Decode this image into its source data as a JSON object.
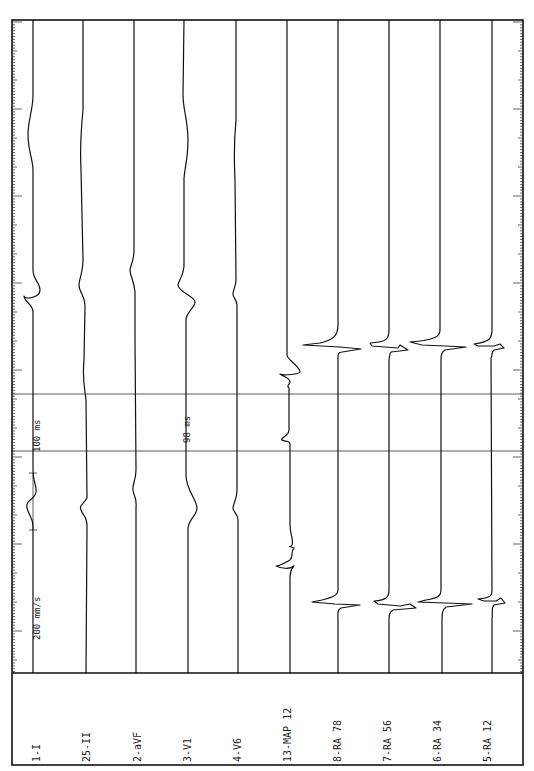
{
  "chart_data": {
    "type": "line",
    "orientation": "rotated-90",
    "paper_speed_label": "200 mm/s",
    "calibration_label": "100 ms",
    "caliper": {
      "label": "98 ms",
      "y1": 394,
      "y2": 451
    },
    "channels": [
      {
        "label": "1-I",
        "x": 33
      },
      {
        "label": "25-II",
        "x": 83
      },
      {
        "label": "2-aVF",
        "x": 134
      },
      {
        "label": "3-V1",
        "x": 184
      },
      {
        "label": "4-V6",
        "x": 236
      },
      {
        "label": "13-MAP 12",
        "x": 287
      },
      {
        "label": "8-RA 78",
        "x": 338
      },
      {
        "label": "7-RA 56",
        "x": 389
      },
      {
        "label": "6-RA 34",
        "x": 440
      },
      {
        "label": "5-RA 12",
        "x": 492
      }
    ],
    "events": [
      {
        "name": "surface-QRS-1",
        "y": 290
      },
      {
        "name": "surface-QRS-2",
        "y": 505
      },
      {
        "name": "RA-activation-1",
        "y": 345
      },
      {
        "name": "RA-activation-2",
        "y": 600
      },
      {
        "name": "MAP-activation-1",
        "y": 372
      },
      {
        "name": "MAP-activation-2",
        "y": 565
      }
    ]
  },
  "frame": {
    "left": 12,
    "right": 523,
    "top": 20,
    "divider": 673,
    "bottom": 765
  },
  "annotations": {
    "speed": "200 mm/s",
    "calibration": "100 ms",
    "interval": "98 ms"
  },
  "traces": {
    "t0": "M33,20 L33,95 C33,110 28,120 28,135 C28,150 33,160 33,170 L33,270 C33,280 40,282 40,290 C40,298 24,300 24,296 C24,302 33,304 33,312 L33,470 C33,482 37,486 36,492 C35,500 25,500 27,508 C29,516 33,518 33,526 L33,673",
    "t1": "M83,20 L83,110 C81,130 80,150 81,170 L83,260 C83,272 79,280 79,285 C79,292 85,296 85,306 L84,360 C82,380 85,390 86,400 L87,498 C83,505 79,505 81,510 C83,516 87,516 87,526 L86,673",
    "t2": "M134,20 L134,250 C134,262 130,266 130,270 C130,276 134,280 135,292 L135,340 L136,470 C136,480 132,485 133,490 C134,498 137,496 136,508 L136,673",
    "t3": "M184,20 L183,95 C183,110 188,120 188,140 C188,160 184,170 184,180 L184,265 C184,275 178,282 178,285 C178,292 195,296 195,302 C195,308 186,312 186,320 L186,475 C186,490 197,500 197,508 C197,516 189,518 188,528 L188,673",
    "t4": "M236,20 L236,120 C234,140 234,160 235,180 L236,280 C236,286 233,290 233,294 C233,298 237,300 237,305 L237,490 C237,500 233,504 233,508 C233,512 238,514 238,520 L238,673",
    "t5": "M287,20 L287,355 C287,360 300,366 300,372 C300,374 283,376 280,374 C286,378 290,378 290,382 C290,384 286,386 289,388 L289,430 C289,436 280,438 282,440 C284,442 290,440 290,444 L290,525 C290,535 294,540 292,545 C290,548 287,545 294,548 C290,552 294,556 290,560 C286,562 280,566 276,566 C280,568 290,570 294,566 C290,570 290,574 290,578 L290,673",
    "t6": "M338,20 L338,325 C338,335 334,340 320,343 L303,345 L340,347 L361,349 L342,352 C337,352 338,356 338,362 L338,590 C338,596 330,598 322,600 L312,602 L335,604 L360,605 L341,608 C337,610 338,614 338,620 L338,673",
    "t7": "M389,20 L389,330 C389,338 388,342 370,343 L372,346 L398,348 L400,345 L408,350 L391,352 C389,355 389,358 389,362 L389,590 C389,597 387,600 374,601 L378,604 L400,606 L410,604 L416,608 L393,610 C389,612 389,616 389,622 L389,673",
    "t8": "M440,20 L440,330 C440,336 436,340 410,342 L422,345 L445,346 L466,347 L445,350 C441,352 441,356 441,362 L441,590 C441,596 438,598 426,600 L418,602 L445,603 L472,604 L446,607 C442,610 442,614 442,620 L442,673",
    "t9": "M492,20 L492,330 C492,338 490,342 474,344 L478,346 L494,346 L500,344 L504,348 L494,350 C491,352 493,355 491,358 L492,590 C492,596 490,598 478,599 L484,601 L496,601 L501,598 L505,603 L494,605 C491,608 493,612 492,618 L492,673"
  }
}
